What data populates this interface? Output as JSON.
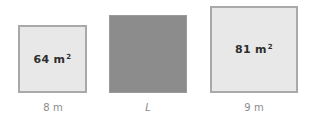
{
  "squares": [
    {
      "id": "left",
      "area_value": "64 m",
      "area_exp": "2",
      "side_label": "8 m",
      "fill": "#e8e8e8"
    },
    {
      "id": "middle",
      "area_value": "",
      "area_exp": "",
      "side_label": "L",
      "fill": "#8c8c8c"
    },
    {
      "id": "right",
      "area_value": "81 m",
      "area_exp": "2",
      "side_label": "9 m",
      "fill": "#e8e8e8"
    }
  ]
}
